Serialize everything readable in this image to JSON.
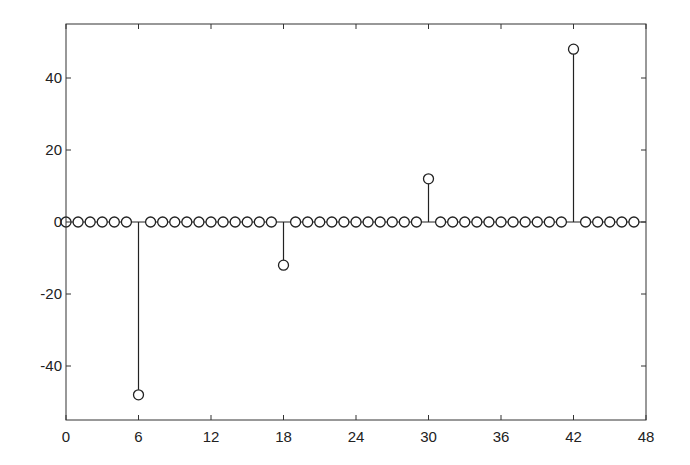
{
  "chart_data": {
    "type": "stem",
    "title": "",
    "xlabel": "",
    "ylabel": "",
    "xlim": [
      0,
      48
    ],
    "ylim": [
      -55,
      55
    ],
    "grid": false,
    "legend": null,
    "x_ticks": [
      0,
      6,
      12,
      18,
      24,
      30,
      36,
      42,
      48
    ],
    "x_tick_labels": [
      "0",
      "6",
      "12",
      "18",
      "24",
      "30",
      "36",
      "42",
      "48"
    ],
    "y_ticks": [
      -40,
      -20,
      0,
      20,
      40
    ],
    "y_tick_labels": [
      "-40",
      "-20",
      "0",
      "20",
      "40"
    ],
    "marker": "circle-open",
    "color": "#222222",
    "x": [
      0,
      1,
      2,
      3,
      4,
      5,
      6,
      7,
      8,
      9,
      10,
      11,
      12,
      13,
      14,
      15,
      16,
      17,
      18,
      19,
      20,
      21,
      22,
      23,
      24,
      25,
      26,
      27,
      28,
      29,
      30,
      31,
      32,
      33,
      34,
      35,
      36,
      37,
      38,
      39,
      40,
      41,
      42,
      43,
      44,
      45,
      46,
      47
    ],
    "values": [
      0,
      0,
      0,
      0,
      0,
      0,
      -48,
      0,
      0,
      0,
      0,
      0,
      0,
      0,
      0,
      0,
      0,
      0,
      -12,
      0,
      0,
      0,
      0,
      0,
      0,
      0,
      0,
      0,
      0,
      0,
      12,
      0,
      0,
      0,
      0,
      0,
      0,
      0,
      0,
      0,
      0,
      0,
      48,
      0,
      0,
      0,
      0,
      0
    ]
  }
}
